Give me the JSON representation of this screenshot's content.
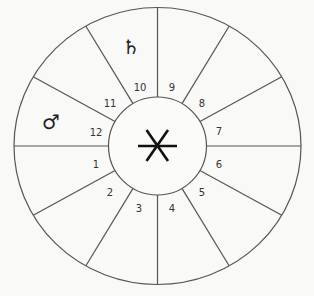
{
  "chart": {
    "type": "astrological-house-wheel",
    "center": {
      "x": 157.5,
      "y": 146
    },
    "outer_radius": {
      "rx": 143.5,
      "ry": 138.5
    },
    "inner_radius": 49,
    "line_color": "#555555",
    "background": "#f9f9f8",
    "center_symbol": "asterisk-star",
    "houses": [
      {
        "number": "1",
        "x": 96,
        "y": 165
      },
      {
        "number": "2",
        "x": 110,
        "y": 193
      },
      {
        "number": "3",
        "x": 139,
        "y": 209
      },
      {
        "number": "4",
        "x": 172,
        "y": 209
      },
      {
        "number": "5",
        "x": 202,
        "y": 193
      },
      {
        "number": "6",
        "x": 219,
        "y": 165
      },
      {
        "number": "7",
        "x": 219,
        "y": 132
      },
      {
        "number": "8",
        "x": 202,
        "y": 104
      },
      {
        "number": "9",
        "x": 172,
        "y": 88
      },
      {
        "number": "10",
        "x": 140,
        "y": 88
      },
      {
        "number": "11",
        "x": 110,
        "y": 104
      },
      {
        "number": "12",
        "x": 96,
        "y": 133
      }
    ],
    "planets": [
      {
        "name": "saturn",
        "glyph": "♄",
        "house": "10",
        "x": 131,
        "y": 47
      },
      {
        "name": "mars",
        "glyph": "♂",
        "house": "12",
        "x": 51,
        "y": 122
      }
    ]
  }
}
